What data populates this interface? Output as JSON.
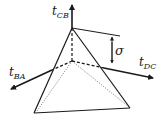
{
  "diagram": {
    "type": "tetrahedron-stress-vectors",
    "labels": {
      "t_cb": {
        "main": "t",
        "sub": "CB"
      },
      "t_dc": {
        "main": "t",
        "sub": "DC"
      },
      "t_ba": {
        "main": "t",
        "sub": "BA"
      },
      "sigma": "σ"
    },
    "colors": {
      "line": "#1a1a1a",
      "dotted": "#555555",
      "background": "#ffffff"
    }
  }
}
